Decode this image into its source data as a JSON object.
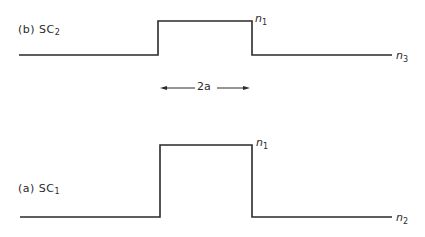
{
  "diagram": {
    "panels": [
      {
        "id": "b",
        "label_prefix": "(b) SC",
        "label_sub": "2",
        "profile": {
          "baseline_y": 55,
          "top_y": 21,
          "start_x": 19,
          "rise_x": 158,
          "fall_x": 252,
          "end_x": 392
        },
        "core_label": "n",
        "core_sub": "1",
        "outer_label": "n",
        "outer_sub": "3"
      },
      {
        "id": "a",
        "label_prefix": "(a) SC",
        "label_sub": "1",
        "profile": {
          "baseline_y": 217,
          "top_y": 145,
          "start_x": 20,
          "rise_x": 160,
          "fall_x": 252,
          "end_x": 392
        },
        "core_label": "n",
        "core_sub": "1",
        "outer_label": "n",
        "outer_sub": "2"
      }
    ],
    "dimension": {
      "label": "2a",
      "from_x": 160,
      "to_x": 250,
      "y": 88
    },
    "colors": {
      "line": "#2a2a2a",
      "background": "#ffffff"
    }
  }
}
